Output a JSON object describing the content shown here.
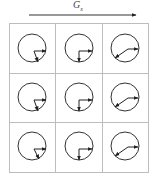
{
  "title": {
    "symbol": "G",
    "subscript": "x"
  },
  "axis_arrow": {
    "direction": "right",
    "color": "#333333"
  },
  "grid": {
    "rows": 3,
    "cols": 3,
    "line_color": "#bdbdbd",
    "cells": [
      {
        "row": 0,
        "col": 0,
        "vectors": [
          "right",
          "down-right-steep"
        ]
      },
      {
        "row": 0,
        "col": 1,
        "vectors": [
          "right",
          "down"
        ]
      },
      {
        "row": 0,
        "col": 2,
        "vectors": [
          "right",
          "down-left"
        ]
      },
      {
        "row": 1,
        "col": 0,
        "vectors": [
          "right",
          "down-right-steep"
        ]
      },
      {
        "row": 1,
        "col": 1,
        "vectors": [
          "right",
          "down"
        ]
      },
      {
        "row": 1,
        "col": 2,
        "vectors": [
          "right",
          "down-left"
        ]
      },
      {
        "row": 2,
        "col": 0,
        "vectors": [
          "right",
          "down-right-steep"
        ]
      },
      {
        "row": 2,
        "col": 1,
        "vectors": [
          "right",
          "down"
        ]
      },
      {
        "row": 2,
        "col": 2,
        "vectors": [
          "right",
          "down-left"
        ]
      }
    ]
  },
  "icons": {
    "cell_glyph": "circle-with-two-arrows",
    "axis": "right-arrow"
  }
}
